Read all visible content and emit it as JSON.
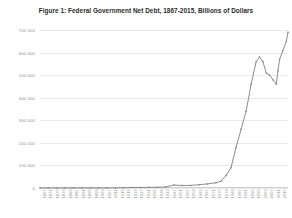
{
  "chart_data": {
    "type": "line",
    "title": "Figure 1: Federal Government Net Debt, 1867-2015, Billions of Dollars",
    "xlabel": "",
    "ylabel": "",
    "ylim": [
      0,
      700000
    ],
    "yticks": [
      0,
      100000,
      200000,
      300000,
      400000,
      500000,
      600000,
      700000
    ],
    "ytick_labels": [
      "0",
      "100 000",
      "200 000",
      "300 000",
      "400 000",
      "500 000",
      "600 000",
      "700 000"
    ],
    "grid": true,
    "legend": "none",
    "line_color": "#808080",
    "marker": "diamond",
    "marker_color": "#8a8a8a",
    "xtick_labels": [
      "1867",
      "1871",
      "1875",
      "1879",
      "1883",
      "1887",
      "1891",
      "1895",
      "1899",
      "1903",
      "1907",
      "1911",
      "1915",
      "1919",
      "1923",
      "1927",
      "1931",
      "1935",
      "1939",
      "1943",
      "1947",
      "1951",
      "1955",
      "1959",
      "1963",
      "1967",
      "1971",
      "1975",
      "1979",
      "1983",
      "1987",
      "1991",
      "1995",
      "1999",
      "2003",
      "2007",
      "2011",
      "2015"
    ],
    "x": [
      1867,
      1872,
      1877,
      1882,
      1887,
      1892,
      1897,
      1902,
      1907,
      1912,
      1917,
      1922,
      1927,
      1932,
      1937,
      1942,
      1947,
      1952,
      1957,
      1962,
      1967,
      1972,
      1975,
      1978,
      1981,
      1984,
      1987,
      1990,
      1993,
      1996,
      1998,
      2000,
      2002,
      2004,
      2006,
      2008,
      2009,
      2010,
      2012,
      2014,
      2015
    ],
    "values": [
      76,
      122,
      151,
      173,
      227,
      241,
      262,
      268,
      316,
      340,
      1200,
      2400,
      2350,
      2830,
      3080,
      4500,
      13100,
      11200,
      11400,
      14800,
      18200,
      23200,
      30000,
      55000,
      90000,
      180000,
      260000,
      340000,
      460000,
      560000,
      580000,
      560000,
      510000,
      500000,
      480000,
      460000,
      520000,
      570000,
      610000,
      650000,
      690000
    ],
    "annotations": []
  }
}
